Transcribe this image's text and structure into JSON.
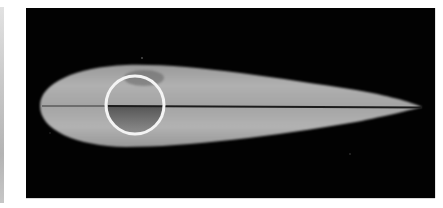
{
  "image": {
    "description": "Grayscale cross-sectional scan of an airfoil with a circular ring marker",
    "colors": {
      "background": "#020202",
      "airfoil_fill": "#a9a9a9",
      "airfoil_highlight": "#bcbcbc",
      "center_line": "#1c1c1c",
      "ring_stroke": "#f4f4f4",
      "left_strip_top": "#e2e2e2",
      "left_strip_bottom": "#b4b4b4"
    },
    "airfoil": {
      "leading_edge_x": 40,
      "trailing_edge_x": 422,
      "max_thickness_top_y": 65,
      "max_thickness_bottom_y": 146,
      "chord_line_y": 106
    },
    "ring_marker": {
      "center_x": 135,
      "center_y": 105,
      "radius": 29,
      "stroke_width": 3
    }
  }
}
